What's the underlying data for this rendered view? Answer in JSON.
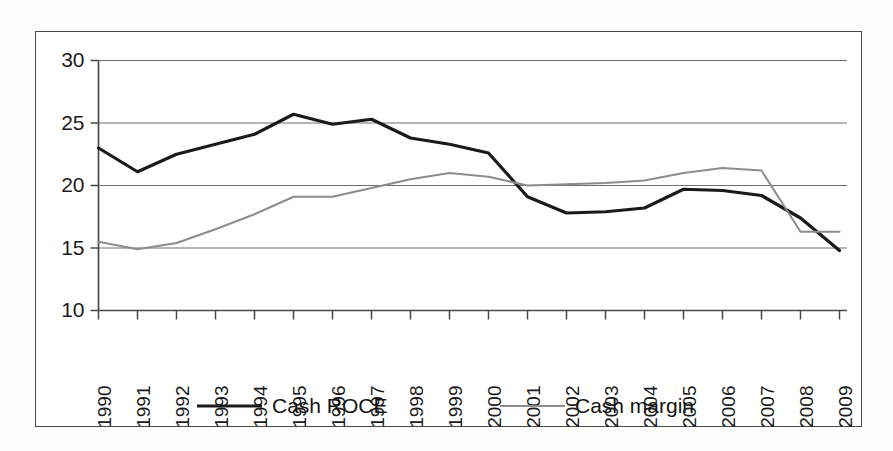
{
  "chart_data": {
    "type": "line",
    "title": "",
    "subtitle": "",
    "xlabel": "",
    "ylabel": "",
    "x": [
      1990,
      1991,
      1992,
      1993,
      1994,
      1995,
      1996,
      1997,
      1998,
      1999,
      2000,
      2001,
      2002,
      2003,
      2004,
      2005,
      2006,
      2007,
      2008,
      2009
    ],
    "categories": [
      "1990",
      "1991",
      "1992",
      "1993",
      "1994",
      "1995",
      "1996",
      "1997",
      "1998",
      "1999",
      "2000",
      "2001",
      "2002",
      "2003",
      "2004",
      "2005",
      "2006",
      "2007",
      "2008",
      "2009"
    ],
    "series": [
      {
        "name": "Cash ROCE",
        "color": "#1a1a1a",
        "line_width": 3.2,
        "values": [
          23.0,
          21.1,
          22.5,
          23.3,
          24.1,
          25.7,
          24.9,
          25.3,
          23.8,
          23.3,
          22.6,
          19.1,
          17.8,
          17.9,
          18.2,
          19.7,
          19.6,
          19.2,
          17.4,
          14.8
        ]
      },
      {
        "name": "Cash margin",
        "color": "#8c8c8c",
        "line_width": 2.0,
        "values": [
          15.5,
          14.9,
          15.4,
          16.5,
          17.7,
          19.1,
          19.1,
          19.8,
          20.5,
          21.0,
          20.7,
          20.0,
          20.1,
          20.2,
          20.4,
          21.0,
          21.4,
          21.2,
          16.3,
          16.3
        ]
      }
    ],
    "ylim": [
      10,
      30
    ],
    "yticks": [
      10,
      15,
      20,
      25,
      30
    ],
    "ytick_labels": [
      "10",
      "15",
      "20",
      "25",
      "30"
    ],
    "grid": true,
    "grid_axis": "y",
    "legend_position": "bottom",
    "xtick_rotation": 90
  },
  "legend": {
    "items": [
      {
        "label": "Cash ROCE",
        "color": "#1a1a1a",
        "swatch": "thick-line-swatch"
      },
      {
        "label": "Cash margin",
        "color": "#8c8c8c",
        "swatch": "thin-line-swatch"
      }
    ]
  },
  "axes": {
    "y_tick_labels": [
      "30",
      "25",
      "20",
      "15",
      "10"
    ],
    "x_tick_labels": [
      "1990",
      "1991",
      "1992",
      "1993",
      "1994",
      "1995",
      "1996",
      "1997",
      "1998",
      "1999",
      "2000",
      "2001",
      "2002",
      "2003",
      "2004",
      "2005",
      "2006",
      "2007",
      "2008",
      "2009"
    ]
  },
  "colors": {
    "series_primary": "#1a1a1a",
    "series_secondary": "#8c8c8c",
    "gridline": "#6e6e6e",
    "axis": "#4a4a4a",
    "frame": "#4a4a4a",
    "background": "#ffffff"
  }
}
